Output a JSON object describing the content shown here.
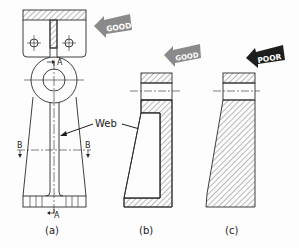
{
  "figure": {
    "views": [
      {
        "id": "a",
        "caption": "(a)"
      },
      {
        "id": "b",
        "caption": "(b)"
      },
      {
        "id": "c",
        "caption": "(c)"
      }
    ],
    "labels": {
      "web": "Web",
      "section_a_top": "A",
      "section_a_bottom": "A",
      "section_b_left": "B",
      "section_b_right": "B"
    },
    "badges": [
      {
        "id": "good-top",
        "text": "GOOD",
        "color": "#8a8a8a"
      },
      {
        "id": "good-b",
        "text": "GOOD",
        "color": "#8a8a8a"
      },
      {
        "id": "poor-c",
        "text": "POOR",
        "color": "#1e1e1e"
      }
    ],
    "colors": {
      "line": "#2a2a2a",
      "hatch": "#3a3a3a",
      "background": "#fdfdfd"
    }
  }
}
